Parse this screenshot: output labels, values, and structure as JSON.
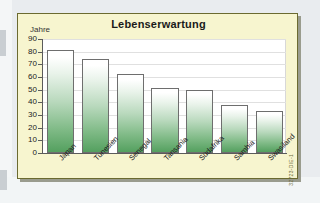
{
  "figure": {
    "title": "Lebenserwartung",
    "y_axis_title": "Jahre",
    "source_code": "32723-DIE-1"
  },
  "chart_data": {
    "type": "bar",
    "title": "Lebenserwartung",
    "xlabel": "",
    "ylabel": "Jahre",
    "ylim": [
      0,
      90
    ],
    "yticks": [
      0,
      10,
      20,
      30,
      40,
      50,
      60,
      70,
      80,
      90
    ],
    "grid": true,
    "legend": null,
    "categories": [
      "Japan",
      "Tunesien",
      "Senegal",
      "Tansania",
      "Südafrika",
      "Sambia",
      "Swasiland"
    ],
    "values": [
      81,
      74,
      62,
      51,
      50,
      38,
      33
    ],
    "bar_color_top": "#ffffff",
    "bar_color_bottom": "#54a05f",
    "panel_color": "#f7f5cf",
    "plot_color": "#ffffff",
    "border_color": "#6b6a30"
  }
}
